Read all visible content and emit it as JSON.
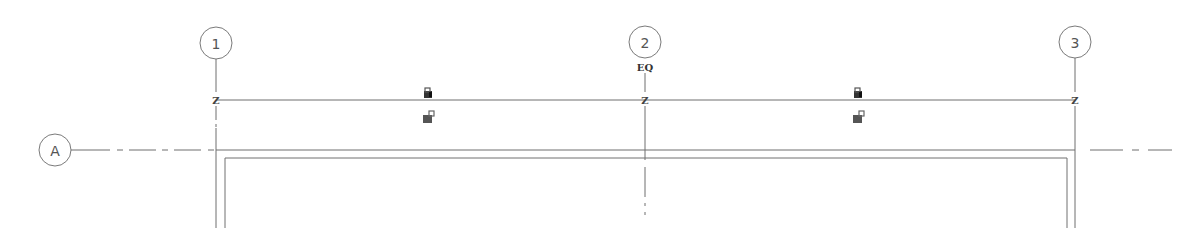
{
  "drawing": {
    "type": "floor-plan-grid",
    "colors": {
      "line": "#6e6e6e",
      "bubble": "#7a7a7a",
      "wall": "#707070",
      "icon": "#444444"
    },
    "vertical_grids": [
      {
        "label": "1",
        "x": 216
      },
      {
        "label": "2",
        "x": 645
      },
      {
        "label": "3",
        "x": 1075
      }
    ],
    "horizontal_grids": [
      {
        "label": "A",
        "y": 150
      }
    ],
    "dimension": {
      "y": 100,
      "eq_label": "EQ",
      "tick_label": "Z"
    },
    "lock_icons": [
      {
        "name": "lock-icon-left-top",
        "x": 428,
        "y": 93
      },
      {
        "name": "lock-icon-left-bottom",
        "x": 428,
        "y": 117
      },
      {
        "name": "lock-icon-right-top",
        "x": 858,
        "y": 93
      },
      {
        "name": "lock-icon-right-bottom",
        "x": 858,
        "y": 117
      }
    ]
  }
}
